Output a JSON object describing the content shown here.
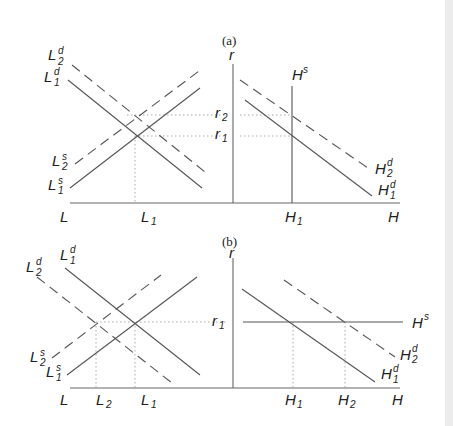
{
  "panels": [
    {
      "caption": "(a)",
      "left_axis_label": "L",
      "right_axis_label": "H",
      "vertical_axis_label": "r",
      "curves_left": [
        "L2d",
        "L1d",
        "L2s",
        "L1s"
      ],
      "curves_right": [
        "Hs",
        "H2d",
        "H1d"
      ],
      "rate_ticks": [
        "r2",
        "r1"
      ],
      "quantity_ticks": [
        "L1",
        "H1"
      ]
    },
    {
      "caption": "(b)",
      "left_axis_label": "L",
      "right_axis_label": "H",
      "vertical_axis_label": "r",
      "curves_left": [
        "L1d",
        "L2d",
        "L2s",
        "L1s"
      ],
      "curves_right": [
        "Hs",
        "H2d",
        "H1d"
      ],
      "rate_ticks": [
        "r1"
      ],
      "quantity_ticks": [
        "L2",
        "L1",
        "H1",
        "H2"
      ]
    }
  ],
  "labels": {
    "caption_a": "(a)",
    "caption_b": "(b)",
    "r": "r",
    "L": "L",
    "H": "H",
    "r_main": "r",
    "sub_1": "1",
    "sub_2": "2",
    "sup_d": "d",
    "sup_s": "s"
  },
  "colors": {
    "line": "#555555",
    "dotted": "#aaaaaa",
    "text": "#222222",
    "side_band": "#ececec"
  }
}
